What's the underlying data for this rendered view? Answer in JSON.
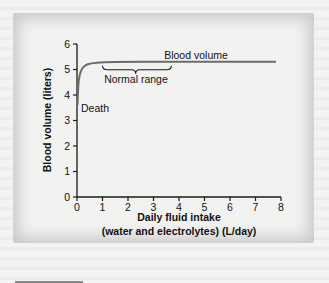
{
  "chart_data": {
    "type": "line",
    "title": "",
    "xlabel": "Daily fluid intake",
    "xlabel_line2": "(water and electrolytes) (L/day)",
    "ylabel": "Blood volume (liters)",
    "xlim": [
      0,
      8
    ],
    "ylim": [
      0,
      6
    ],
    "xticks": [
      "0",
      "1",
      "2",
      "3",
      "4",
      "5",
      "6",
      "7",
      "8"
    ],
    "yticks": [
      "0",
      "1",
      "2",
      "3",
      "4",
      "5",
      "6"
    ],
    "grid": false,
    "series": [
      {
        "name": "Blood volume",
        "x": [
          0.02,
          0.05,
          0.1,
          0.2,
          0.35,
          0.5,
          0.8,
          1.0,
          2.0,
          3.0,
          4.0,
          5.0,
          6.0,
          7.0,
          7.8
        ],
        "y": [
          3.6,
          4.4,
          4.8,
          5.05,
          5.18,
          5.23,
          5.27,
          5.28,
          5.3,
          5.3,
          5.3,
          5.3,
          5.3,
          5.3,
          5.3
        ]
      }
    ],
    "annotations": [
      {
        "text": "Blood volume",
        "x": 5.3,
        "y": 5.55
      },
      {
        "text": "Normal range",
        "x": 2.3,
        "y": 4.75,
        "brace_from": 1.0,
        "brace_to": 3.7
      },
      {
        "text": "Death",
        "x": 0.15,
        "y": 3.4
      }
    ]
  },
  "labels": {
    "series_label": "Blood volume",
    "range_label": "Normal range",
    "death_label": "Death",
    "ylabel": "Blood volume (liters)",
    "xlabel": "Daily fluid intake",
    "xlabel2": "(water and electrolytes) (L/day)",
    "xticks": [
      "0",
      "1",
      "2",
      "3",
      "4",
      "5",
      "6",
      "7",
      "8"
    ],
    "yticks": [
      "0",
      "1",
      "2",
      "3",
      "4",
      "5",
      "6"
    ]
  },
  "colors": {
    "curve": "#6b6b6b",
    "axis": "#1a1a1a",
    "background": "#f2f2f1"
  }
}
